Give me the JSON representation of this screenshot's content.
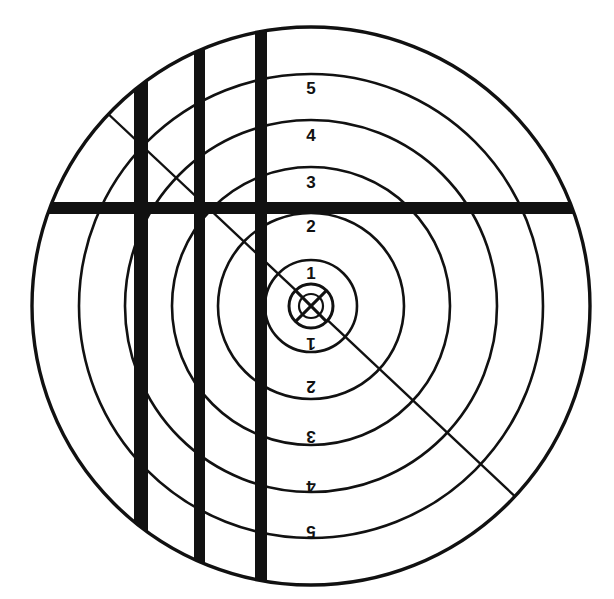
{
  "figure": {
    "name": "circular-shooting-target-diagram",
    "background_color": "#ffffff",
    "ink_color": "#111111",
    "width": 614,
    "height": 599
  },
  "target": {
    "center": {
      "x": 311,
      "y": 306
    },
    "rings": [
      {
        "index": 1,
        "radius": 46,
        "stroke": 2.6
      },
      {
        "index": 2,
        "radius": 93,
        "stroke": 2.6
      },
      {
        "index": 3,
        "radius": 139,
        "stroke": 2.6
      },
      {
        "index": 4,
        "radius": 186,
        "stroke": 2.6
      },
      {
        "index": 5,
        "radius": 232,
        "stroke": 2.6
      },
      {
        "index": 6,
        "radius": 279,
        "stroke": 3.4
      }
    ],
    "bullseye": {
      "radius": 22,
      "stroke": 3.0
    },
    "inner_ring": {
      "radius": 12,
      "stroke": 2.2
    }
  },
  "labels": {
    "upper": [
      {
        "text": "5",
        "x": 311,
        "y": 90,
        "rotation": 0
      },
      {
        "text": "4",
        "x": 311,
        "y": 137,
        "rotation": 0
      },
      {
        "text": "3",
        "x": 311,
        "y": 184,
        "rotation": 0
      },
      {
        "text": "2",
        "x": 311,
        "y": 228,
        "rotation": 0
      },
      {
        "text": "1",
        "x": 311,
        "y": 275,
        "rotation": 0
      }
    ],
    "lower": [
      {
        "text": "1",
        "x": 311,
        "y": 342,
        "rotation": 180
      },
      {
        "text": "2",
        "x": 311,
        "y": 385,
        "rotation": 180
      },
      {
        "text": "3",
        "x": 311,
        "y": 435,
        "rotation": 180
      },
      {
        "text": "4",
        "x": 311,
        "y": 485,
        "rotation": 180
      },
      {
        "text": "5",
        "x": 311,
        "y": 530,
        "rotation": 180
      }
    ]
  },
  "bars": {
    "vertical": [
      {
        "name": "vertical-bar-left",
        "x": 134,
        "width": 14
      },
      {
        "name": "vertical-bar-middle",
        "x": 194,
        "width": 11
      },
      {
        "name": "vertical-bar-right",
        "x": 255,
        "width": 12
      }
    ],
    "horizontal": [
      {
        "name": "horizontal-bar",
        "y": 202,
        "height": 12
      }
    ]
  },
  "diagonal": {
    "name": "diagonal-line",
    "x1": 104,
    "y1": 110,
    "x2": 521,
    "y2": 502,
    "stroke": 2.4
  }
}
